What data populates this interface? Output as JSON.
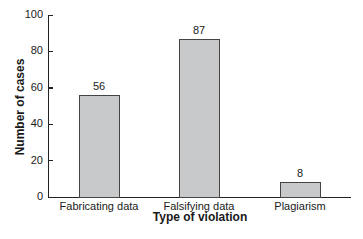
{
  "chart_data": {
    "type": "bar",
    "title": "",
    "xlabel": "Type of violation",
    "ylabel": "Number of cases",
    "categories": [
      "Fabricating data",
      "Falsifying data",
      "Plagiarism"
    ],
    "values": [
      56,
      87,
      8
    ],
    "value_labels": [
      "56",
      "87",
      "8"
    ],
    "ylim": [
      0,
      100
    ],
    "yticks": [
      0,
      20,
      40,
      60,
      80,
      100
    ],
    "ytick_labels": [
      "0",
      "20",
      "40",
      "60",
      "80",
      "100"
    ],
    "grid": false,
    "legend": null,
    "bar_color": "#c8c9cb",
    "bar_edge_color": "#444444"
  }
}
